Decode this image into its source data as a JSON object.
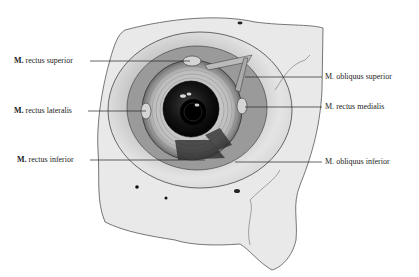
{
  "figure": {
    "labels_left": [
      {
        "id": "rectus-superior",
        "prefix": "M.",
        "text": "rectus superior",
        "x": 14,
        "y": 56,
        "line": [
          90,
          61,
          190,
          61
        ]
      },
      {
        "id": "rectus-lateralis",
        "prefix": "M.",
        "text": "rectus lateralis",
        "x": 14,
        "y": 106,
        "line": [
          88,
          111,
          146,
          111
        ]
      },
      {
        "id": "rectus-inferior",
        "prefix": "M.",
        "text": "rectus inferior",
        "x": 17,
        "y": 155,
        "line": [
          90,
          160,
          205,
          160
        ]
      }
    ],
    "labels_right": [
      {
        "id": "obliquus-superior",
        "prefix": "M.",
        "text": "obliquus superior",
        "x": 325,
        "y": 72,
        "line": [
          245,
          77,
          322,
          77
        ]
      },
      {
        "id": "rectus-medialis",
        "prefix": "M.",
        "text": "rectus medialis",
        "x": 325,
        "y": 102,
        "line": [
          245,
          107,
          322,
          107
        ]
      },
      {
        "id": "obliquus-inferior",
        "prefix": "M.",
        "text": "obliquus inferior",
        "x": 325,
        "y": 157,
        "line": [
          235,
          162,
          322,
          162
        ]
      }
    ],
    "colors": {
      "bone": "#e6e6e6",
      "bone_shadow": "#b9b9b9",
      "orbit": "#8a8a8a",
      "sclera": "#c9c9c9",
      "iris": "#1a1a1a",
      "line": "#222222",
      "text": "#222222"
    }
  }
}
